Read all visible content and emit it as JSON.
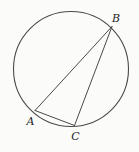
{
  "figure": {
    "background_color": "#fbfbfa",
    "stroke_color": "#4a4a4a",
    "label_color": "#1f1f1f",
    "circle": {
      "cx": 71,
      "cy": 69,
      "r": 57.5,
      "stroke_width": 1.1
    },
    "chord_stroke_width": 1,
    "vertices": {
      "A": {
        "x": 35,
        "y": 110.5,
        "label": "A",
        "label_x": 30.5,
        "label_y": 125
      },
      "B": {
        "x": 112,
        "y": 26.5,
        "label": "B",
        "label_x": 116,
        "label_y": 21.5
      },
      "C": {
        "x": 74.5,
        "y": 125.5,
        "label": "C",
        "label_x": 75.5,
        "label_y": 139.5
      }
    },
    "edges": [
      {
        "from": "A",
        "to": "B"
      },
      {
        "from": "B",
        "to": "C"
      },
      {
        "from": "A",
        "to": "C"
      }
    ]
  }
}
